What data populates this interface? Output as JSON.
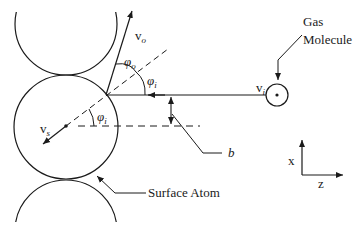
{
  "diagram": {
    "type": "gas-surface scattering geometry",
    "labels": {
      "gas_line1": "Gas",
      "gas_line2": "Molecule",
      "surface_atom": "Surface Atom",
      "impact_parameter": "b",
      "v_outgoing": "v",
      "v_outgoing_sub": "o",
      "phi_outgoing": "φ",
      "phi_outgoing_sub": "o",
      "phi_incident_top": "φ",
      "phi_incident_top_sub": "i",
      "phi_incident_center": "φ",
      "phi_incident_center_sub": "i",
      "v_incident": "v",
      "v_incident_sub": "i",
      "v_surface": "v",
      "v_surface_sub": "s",
      "axis_x": "x",
      "axis_z": "z"
    },
    "colors": {
      "stroke": "#1a1a1a",
      "background": "#ffffff"
    }
  }
}
